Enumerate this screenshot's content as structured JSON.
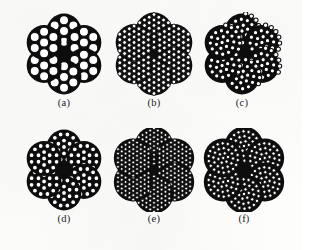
{
  "figure": {
    "kind": "scanned-technical-figure",
    "caption_style": "lettered-subfigures",
    "background_color": "#fdfdfc",
    "ink_color": "#0d0d0d",
    "wire_fill_color": "#ffffff",
    "wire_outline_color": "#0d0d0d",
    "width": 302,
    "height": 250
  },
  "panels": [
    {
      "id": "panel-a",
      "label": "(a)",
      "x": 22,
      "y": 12,
      "size": 84,
      "strand_count": 6,
      "core_present": true,
      "strand_layout": "hexagonal",
      "wires_per_strand": 7,
      "strand_radius": 17,
      "wire_radius": 5.4,
      "rosette_radius": 23,
      "strand_rotation": 0,
      "description": "6 strands of 7 wires around a fibre core"
    },
    {
      "id": "panel-b",
      "label": "(b)",
      "x": 112,
      "y": 12,
      "size": 84,
      "strand_count": 6,
      "core_present": true,
      "strand_layout": "hexagonal",
      "wires_per_strand": 37,
      "strand_radius": 18,
      "wire_radius": 2.75,
      "rosette_radius": 23,
      "strand_rotation": 0,
      "description": "6 strands of 37 wires around a fibre core"
    },
    {
      "id": "panel-c",
      "label": "(c)",
      "x": 200,
      "y": 12,
      "size": 84,
      "strand_count": 6,
      "core_present": true,
      "strand_layout": "concentric",
      "wires_per_strand": 25,
      "strand_radius": 17,
      "wire_radius": 3.0,
      "rosette_radius": 23,
      "strand_rotation": 12,
      "description": "6 compound strands with layered wires around a fibre core"
    },
    {
      "id": "panel-d",
      "label": "(d)",
      "x": 22,
      "y": 128,
      "size": 84,
      "strand_count": 6,
      "core_present": true,
      "strand_layout": "concentric",
      "wires_per_strand": 19,
      "strand_radius": 17,
      "wire_radius": 3.3,
      "rosette_radius": 23,
      "strand_rotation": 0,
      "description": "6 strands of 19 wires in concentric rings around a fibre core"
    },
    {
      "id": "panel-e",
      "label": "(e)",
      "x": 112,
      "y": 128,
      "size": 84,
      "strand_count": 6,
      "core_present": true,
      "strand_layout": "hexagonal",
      "wires_per_strand": 61,
      "strand_radius": 19,
      "wire_radius": 2.2,
      "rosette_radius": 24,
      "strand_rotation": 0,
      "description": "6 strands of 61 fine wires around a fibre core"
    },
    {
      "id": "panel-f",
      "label": "(f)",
      "x": 202,
      "y": 128,
      "size": 84,
      "strand_count": 6,
      "core_present": true,
      "strand_layout": "concentric",
      "wires_per_strand": 37,
      "strand_radius": 19,
      "wire_radius": 2.5,
      "rosette_radius": 24,
      "strand_rotation": 18,
      "description": "6 compound strands of fine layered wires around a fibre core"
    }
  ]
}
